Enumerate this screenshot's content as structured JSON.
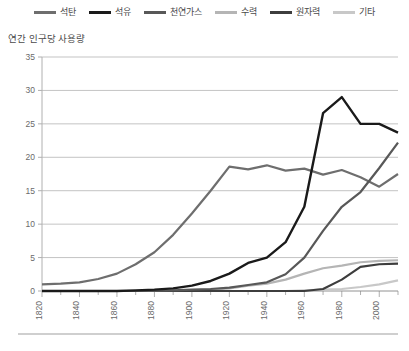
{
  "legend": {
    "items": [
      {
        "label": "석탄",
        "color": "#6e6e6e",
        "key": "coal"
      },
      {
        "label": "석유",
        "color": "#1a1a1a",
        "key": "oil"
      },
      {
        "label": "천연가스",
        "color": "#585858",
        "key": "gas"
      },
      {
        "label": "수력",
        "color": "#b5b5b5",
        "key": "hydro"
      },
      {
        "label": "원자력",
        "color": "#3d3d3d",
        "key": "nuclear"
      },
      {
        "label": "기타",
        "color": "#c8c8c8",
        "key": "other"
      }
    ]
  },
  "axis_title": "연간 인구당 사용량",
  "chart_data": {
    "type": "line",
    "title": "",
    "subtitle": "",
    "xlabel": "",
    "ylabel": "연간 인구당 사용량",
    "xlim": [
      1820,
      2010
    ],
    "ylim": [
      0,
      35
    ],
    "ytick_values": [
      0,
      5,
      10,
      15,
      20,
      25,
      30,
      35
    ],
    "ytick_labels": [
      "0",
      "5",
      "10",
      "15",
      "20",
      "25",
      "30",
      "35"
    ],
    "xtick_labels": [
      "1820",
      "1840",
      "1860",
      "1880",
      "1900",
      "1920",
      "1940",
      "1960",
      "1980",
      "2000"
    ],
    "xtick_values": [
      1820,
      1840,
      1860,
      1880,
      1900,
      1920,
      1940,
      1960,
      1980,
      2000
    ],
    "xminor_step": 10,
    "grid": "horizontal",
    "legend_position": "top",
    "x": [
      1820,
      1830,
      1840,
      1850,
      1860,
      1870,
      1880,
      1890,
      1900,
      1910,
      1920,
      1930,
      1940,
      1950,
      1960,
      1970,
      1980,
      1990,
      2000,
      2010
    ],
    "series": [
      {
        "name": "석탄",
        "color": "#6e6e6e",
        "width": 2.2,
        "values": [
          1.0,
          1.1,
          1.3,
          1.8,
          2.6,
          4.0,
          5.8,
          8.4,
          11.6,
          15.0,
          18.6,
          18.2,
          18.8,
          18.0,
          18.3,
          17.4,
          18.1,
          17.0,
          15.6,
          17.5
        ]
      },
      {
        "name": "석유",
        "color": "#1a1a1a",
        "width": 2.4,
        "values": [
          0.0,
          0.0,
          0.0,
          0.0,
          0.0,
          0.1,
          0.2,
          0.4,
          0.8,
          1.5,
          2.6,
          4.2,
          5.0,
          7.3,
          12.6,
          26.6,
          29.0,
          25.0,
          25.0,
          23.7
        ]
      },
      {
        "name": "천연가스",
        "color": "#585858",
        "width": 2.2,
        "values": [
          0.0,
          0.0,
          0.0,
          0.0,
          0.0,
          0.0,
          0.0,
          0.1,
          0.2,
          0.3,
          0.5,
          0.9,
          1.3,
          2.5,
          5.0,
          9.0,
          12.6,
          14.8,
          18.4,
          22.2
        ]
      },
      {
        "name": "수력",
        "color": "#b5b5b5",
        "width": 2.2,
        "values": [
          0.0,
          0.0,
          0.0,
          0.0,
          0.0,
          0.0,
          0.0,
          0.0,
          0.1,
          0.2,
          0.4,
          0.8,
          1.1,
          1.7,
          2.6,
          3.4,
          3.8,
          4.3,
          4.5,
          4.6
        ]
      },
      {
        "name": "원자력",
        "color": "#3d3d3d",
        "width": 2.2,
        "values": [
          0.0,
          0.0,
          0.0,
          0.0,
          0.0,
          0.0,
          0.0,
          0.0,
          0.0,
          0.0,
          0.0,
          0.0,
          0.0,
          0.0,
          0.0,
          0.3,
          1.7,
          3.6,
          4.0,
          4.1
        ]
      },
      {
        "name": "기타",
        "color": "#c8c8c8",
        "width": 2.2,
        "values": [
          0.0,
          0.0,
          0.0,
          0.0,
          0.0,
          0.0,
          0.0,
          0.0,
          0.0,
          0.0,
          0.0,
          0.0,
          0.0,
          0.0,
          0.1,
          0.2,
          0.3,
          0.6,
          1.0,
          1.6
        ]
      }
    ]
  }
}
